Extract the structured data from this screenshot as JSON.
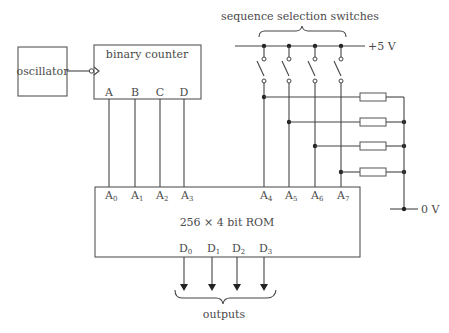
{
  "diagram": {
    "oscillator": {
      "label": "oscillator"
    },
    "counter": {
      "label": "binary counter",
      "outputs": [
        "A",
        "B",
        "C",
        "D"
      ]
    },
    "switches": {
      "label": "sequence selection switches",
      "count": 4
    },
    "supply": {
      "positive": "+5 V",
      "ground": "0 V"
    },
    "rom": {
      "label": "256 × 4 bit ROM",
      "address_inputs": [
        {
          "base": "A",
          "sub": "0"
        },
        {
          "base": "A",
          "sub": "1"
        },
        {
          "base": "A",
          "sub": "2"
        },
        {
          "base": "A",
          "sub": "3"
        },
        {
          "base": "A",
          "sub": "4"
        },
        {
          "base": "A",
          "sub": "5"
        },
        {
          "base": "A",
          "sub": "6"
        },
        {
          "base": "A",
          "sub": "7"
        }
      ],
      "data_outputs": [
        {
          "base": "D",
          "sub": "0"
        },
        {
          "base": "D",
          "sub": "1"
        },
        {
          "base": "D",
          "sub": "2"
        },
        {
          "base": "D",
          "sub": "3"
        }
      ]
    },
    "resistors": {
      "count": 4
    },
    "outputs_label": "outputs"
  }
}
